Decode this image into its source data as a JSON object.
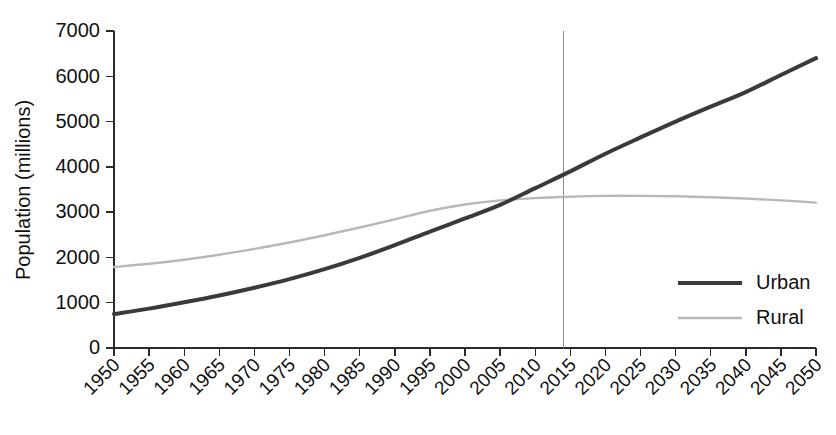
{
  "chart_data": {
    "type": "line",
    "title": "",
    "subtitle": "",
    "xlabel": "",
    "ylabel": "Population (millions)",
    "xlim": [
      1950,
      2050
    ],
    "ylim": [
      0,
      7000
    ],
    "grid": false,
    "legend_position": "center-right",
    "x_tick_labels": [
      "1950",
      "1955",
      "1960",
      "1965",
      "1970",
      "1975",
      "1980",
      "1985",
      "1990",
      "1995",
      "2000",
      "2005",
      "2010",
      "2015",
      "2020",
      "2025",
      "2030",
      "2035",
      "2040",
      "2045",
      "2050"
    ],
    "y_tick_labels": [
      "0",
      "1000",
      "2000",
      "3000",
      "4000",
      "5000",
      "6000",
      "7000"
    ],
    "y_ticks": [
      0,
      1000,
      2000,
      3000,
      4000,
      5000,
      6000,
      7000
    ],
    "x": [
      1950,
      1955,
      1960,
      1965,
      1970,
      1975,
      1980,
      1985,
      1990,
      1995,
      2000,
      2005,
      2010,
      2015,
      2020,
      2025,
      2030,
      2035,
      2040,
      2045,
      2050
    ],
    "series": [
      {
        "name": "Urban",
        "color": "#3a3a3a",
        "width": 4.0,
        "values": [
          750,
          870,
          1010,
          1160,
          1330,
          1520,
          1740,
          1990,
          2270,
          2570,
          2860,
          3160,
          3530,
          3900,
          4290,
          4650,
          5000,
          5330,
          5650,
          6030,
          6400
        ]
      },
      {
        "name": "Rural",
        "color": "#b8b8b8",
        "width": 2.4,
        "values": [
          1790,
          1860,
          1950,
          2060,
          2190,
          2330,
          2490,
          2660,
          2840,
          3030,
          3170,
          3260,
          3310,
          3340,
          3360,
          3360,
          3350,
          3330,
          3300,
          3260,
          3210
        ]
      }
    ],
    "reference_line": {
      "name": "year-marker",
      "x": 2014,
      "color": "#8d8d8d"
    },
    "legend": [
      {
        "label": "Urban",
        "color": "#3a3a3a",
        "width": 4.0
      },
      {
        "label": "Rural",
        "color": "#b8b8b8",
        "width": 2.4
      }
    ]
  }
}
